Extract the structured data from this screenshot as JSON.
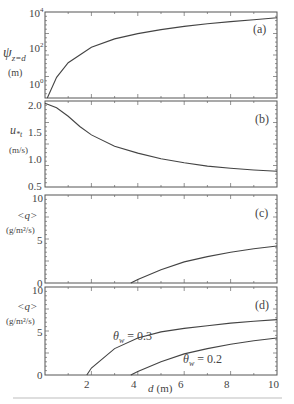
{
  "figure": {
    "xlabel": "d (m)",
    "xlabel_var": "d",
    "xlabel_unit": "(m)",
    "x_ticks": [
      "2",
      "4",
      "6",
      "8",
      "10"
    ]
  },
  "panels": [
    {
      "id": "a",
      "tag": "(a)",
      "ylabel_sym": "ψ",
      "ylabel_sub": "z=d",
      "ylabel_unit": "(m)",
      "y_ticks": [
        {
          "label": "10",
          "exp": "4"
        },
        {
          "label": "10",
          "exp": "2"
        },
        {
          "label": "10",
          "exp": "0"
        }
      ]
    },
    {
      "id": "b",
      "tag": "(b)",
      "ylabel_sym": "u",
      "ylabel_sub": "*t",
      "ylabel_unit": "(m/s)",
      "y_ticks": [
        "2.0",
        "1.5",
        "1.0",
        "0.5"
      ]
    },
    {
      "id": "c",
      "tag": "(c)",
      "ylabel_sym": "<q>",
      "ylabel_unit": "(g/m²/s)",
      "y_ticks": [
        "10",
        "5",
        "0"
      ]
    },
    {
      "id": "d",
      "tag": "(d)",
      "ylabel_sym": "<q>",
      "ylabel_unit": "(g/m²/s)",
      "y_ticks": [
        "10",
        "5",
        "0"
      ],
      "annotations": [
        {
          "text": "θ",
          "sub": "w",
          "rest": " = 0.3"
        },
        {
          "text": "θ",
          "sub": "w",
          "rest": " = 0.2"
        }
      ]
    }
  ],
  "chart_data": [
    {
      "type": "line",
      "panel": "(a)",
      "xlabel": "d (m)",
      "ylabel": "ψ_{z=d} (m)",
      "yscale": "log",
      "xlim": [
        0,
        10
      ],
      "ylim": [
        0.1,
        20000
      ],
      "x": [
        0.1,
        0.5,
        1,
        2,
        3,
        4,
        5,
        6,
        7,
        8,
        9,
        10
      ],
      "series": [
        {
          "name": "psi",
          "values": [
            0.1,
            3,
            20,
            150,
            450,
            900,
            1500,
            2300,
            3200,
            4300,
            5500,
            7000
          ]
        }
      ]
    },
    {
      "type": "line",
      "panel": "(b)",
      "xlabel": "d (m)",
      "ylabel": "u*t (m/s)",
      "xlim": [
        0,
        10
      ],
      "ylim": [
        0.5,
        2.05
      ],
      "x": [
        0,
        0.5,
        1,
        1.5,
        2,
        3,
        4,
        5,
        6,
        7,
        8,
        9,
        10
      ],
      "series": [
        {
          "name": "u*t",
          "values": [
            1.98,
            1.9,
            1.75,
            1.57,
            1.42,
            1.22,
            1.1,
            1.0,
            0.93,
            0.87,
            0.83,
            0.8,
            0.78
          ]
        }
      ]
    },
    {
      "type": "line",
      "panel": "(c)",
      "xlabel": "d (m)",
      "ylabel": "<q> (g/m²/s)",
      "xlim": [
        0,
        10
      ],
      "ylim": [
        0,
        10
      ],
      "x": [
        3.7,
        4,
        5,
        6,
        7,
        8,
        9,
        10
      ],
      "series": [
        {
          "name": "<q>",
          "values": [
            0,
            0.4,
            1.5,
            2.4,
            3.0,
            3.5,
            3.9,
            4.2
          ]
        }
      ]
    },
    {
      "type": "line",
      "panel": "(d)",
      "xlabel": "d (m)",
      "ylabel": "<q> (g/m²/s)",
      "xlim": [
        0,
        10
      ],
      "ylim": [
        0,
        10
      ],
      "x": [
        1.8,
        2,
        3,
        4,
        5,
        6,
        7,
        8,
        9,
        10
      ],
      "series": [
        {
          "name": "θw = 0.3",
          "x": [
            1.8,
            2,
            3,
            4,
            5,
            6,
            7,
            8,
            9,
            10
          ],
          "values": [
            0,
            0.8,
            3.0,
            4.2,
            4.9,
            5.3,
            5.6,
            5.9,
            6.1,
            6.3
          ]
        },
        {
          "name": "θw = 0.2",
          "x": [
            3.7,
            4,
            5,
            6,
            7,
            8,
            9,
            10
          ],
          "values": [
            0,
            0.4,
            1.5,
            2.4,
            3.0,
            3.5,
            3.9,
            4.2
          ]
        }
      ]
    }
  ]
}
